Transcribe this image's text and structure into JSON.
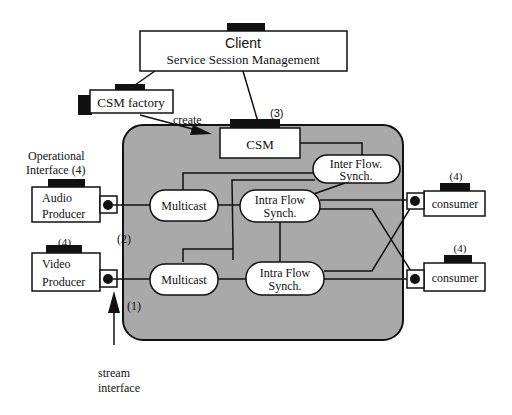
{
  "diagram": {
    "colors": {
      "background": "#ffffff",
      "region_fill": "#a9a9a9",
      "stroke": "#111111",
      "box_fill": "#ffffff"
    },
    "client": {
      "title": "Client",
      "subtitle": "Service Session Management"
    },
    "csm_factory": {
      "label": "CSM factory"
    },
    "create_label": "create",
    "csm": {
      "label": "CSM",
      "marker": "(3)"
    },
    "inter_flow": {
      "line1": "Inter Flow.",
      "line2": "Synch."
    },
    "operational_interface": {
      "line1": "Operational",
      "line2": "Interface (4)"
    },
    "audio_producer": {
      "line1": "Audio",
      "line2": "Producer"
    },
    "video_producer": {
      "line1": "Video",
      "line2": "Producer",
      "marker": "(4)"
    },
    "multicast_top": {
      "label": "Multicast"
    },
    "multicast_bottom": {
      "label": "Multicast"
    },
    "intra_flow_top": {
      "line1": "Intra Flow",
      "line2": "Synch."
    },
    "intra_flow_bottom": {
      "line1": "Intra Flow",
      "line2": "Synch."
    },
    "consumer_top": {
      "label": "consumer",
      "marker": "(4)"
    },
    "consumer_bottom": {
      "label": "consumer",
      "marker": "(4)"
    },
    "marker_2": "(2)",
    "marker_1": "(1)",
    "stream_interface": {
      "line1": "stream",
      "line2": "interface"
    }
  }
}
